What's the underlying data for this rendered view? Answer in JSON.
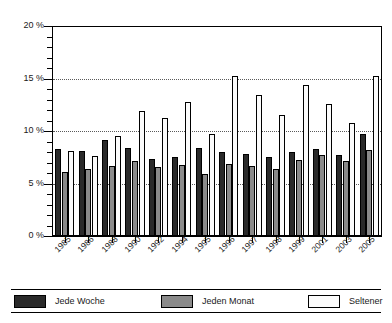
{
  "chart_data": {
    "type": "bar",
    "title": "",
    "subtitle": "",
    "xlabel": "",
    "ylabel": "",
    "grid": true,
    "legend_position": "bottom",
    "ylim": [
      0,
      20
    ],
    "y_unit": "%",
    "y_ticks": [
      0,
      5,
      10,
      15,
      20
    ],
    "y_tick_labels": [
      "0 %",
      "5 %",
      "10 %",
      "15 %",
      "20 %"
    ],
    "y_minor_tick_step": 1,
    "categories": [
      "1985",
      "1986",
      "1988",
      "1990",
      "1992",
      "1994",
      "1995",
      "1996",
      "1997",
      "1998",
      "1999",
      "2001",
      "2003",
      "2005"
    ],
    "series": [
      {
        "name": "Jede Woche",
        "color": "#2a2a2a",
        "values": [
          8.3,
          8.1,
          9.1,
          8.4,
          7.3,
          7.5,
          8.4,
          8.0,
          7.8,
          7.5,
          8.0,
          8.3,
          7.7,
          9.7
        ]
      },
      {
        "name": "Jeden Monat",
        "color": "#8a8a8a",
        "values": [
          6.1,
          6.4,
          6.7,
          7.1,
          6.6,
          6.8,
          5.9,
          6.9,
          6.7,
          6.4,
          7.2,
          7.7,
          7.1,
          8.2
        ]
      },
      {
        "name": "Seltener",
        "color": "#fbfbfb",
        "values": [
          8.1,
          7.6,
          9.5,
          11.9,
          11.2,
          12.8,
          9.7,
          15.2,
          13.4,
          11.5,
          14.4,
          12.6,
          10.8,
          15.2
        ]
      }
    ]
  },
  "legend": {
    "entries": [
      {
        "label": "Jede Woche"
      },
      {
        "label": "Jeden Monat"
      },
      {
        "label": "Seltener"
      }
    ]
  }
}
